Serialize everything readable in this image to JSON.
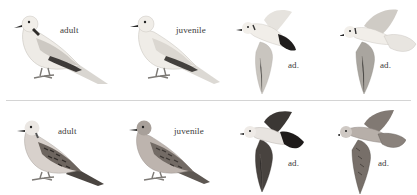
{
  "plate": {
    "rows": [
      {
        "name": "pale-dove-row",
        "figures": [
          {
            "pose": "perched",
            "label": "adult"
          },
          {
            "pose": "perched",
            "label": "juvenile"
          },
          {
            "pose": "flight",
            "label": "ad."
          },
          {
            "pose": "flight",
            "label": "ad."
          }
        ]
      },
      {
        "name": "scaly-dove-row",
        "figures": [
          {
            "pose": "perched",
            "label": "adult"
          },
          {
            "pose": "perched",
            "label": "juvenile"
          },
          {
            "pose": "flight",
            "label": "ad."
          },
          {
            "pose": "flight",
            "label": "ad."
          }
        ]
      }
    ],
    "colors": {
      "background": "#ffffff",
      "divider": "#d4d4d4",
      "label_text": "#3a3a3a",
      "pale_body": "#ece9e4",
      "pale_wing": "#cfcbc6",
      "primaries_dark": "#3d3a38",
      "scaly_body": "#b9aea8",
      "scaly_wing": "#6d655f"
    }
  }
}
